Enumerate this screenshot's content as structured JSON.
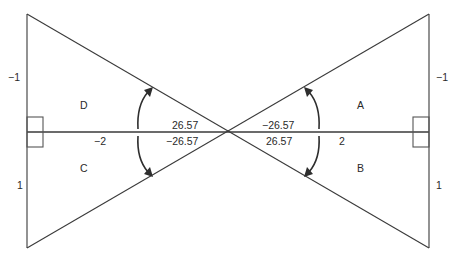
{
  "diagram": {
    "type": "bowtie-triangles",
    "quadrant_labels": {
      "A": "A",
      "B": "B",
      "C": "C",
      "D": "D"
    },
    "side_labels": {
      "left_top": "−1",
      "left_bottom": "1",
      "right_top": "−1",
      "right_bottom": "1",
      "left_horizontal": "−2",
      "right_horizontal": "2"
    },
    "angle_labels": {
      "left_upper": "26.57",
      "left_lower": "−26.57",
      "right_upper": "−26.57",
      "right_lower": "26.57"
    }
  }
}
